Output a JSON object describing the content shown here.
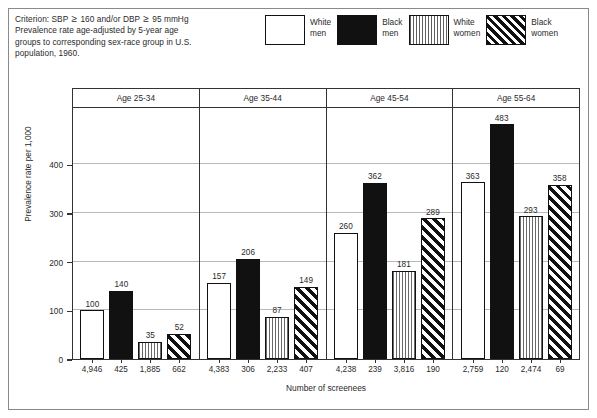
{
  "caption": {
    "line1_pre": "Criterion: SBP ",
    "line1_ge1": "≥",
    "line1_mid": " 160 and/or DBP ",
    "line1_ge2": "≥",
    "line1_post": " 95 mmHg",
    "line2": "Prevalence rate age-adjusted by 5-year age",
    "line3": "groups to corresponding sex-race group in U.S.",
    "line4": "population, 1960."
  },
  "legend": {
    "items": [
      {
        "label": "White\nmen",
        "swatch": "white-box-swatch"
      },
      {
        "label": "Black\nmen",
        "swatch": "solid-black-swatch"
      },
      {
        "label": "White\nwomen",
        "swatch": "vertical-stripe-swatch"
      },
      {
        "label": "Black\nwomen",
        "swatch": "diagonal-stripe-swatch"
      }
    ]
  },
  "chart_data": {
    "type": "bar",
    "title": "",
    "xlabel": "Number of screenees",
    "ylabel": "Prevalence rate per 1,000",
    "ylim": [
      0,
      520
    ],
    "yticks": [
      0,
      100,
      200,
      300,
      400
    ],
    "ytick_labels": [
      "0",
      "100",
      "200",
      "300",
      "400"
    ],
    "grid": true,
    "legend_position": "top-right",
    "categories": [
      "Age 25-34",
      "Age 35-44",
      "Age 45-54",
      "Age 55-64"
    ],
    "series": [
      {
        "name": "White men",
        "values": [
          100,
          157,
          260,
          363
        ],
        "screenees": [
          "4,946",
          "4,383",
          "4,238",
          "2,759"
        ]
      },
      {
        "name": "Black men",
        "values": [
          140,
          206,
          362,
          483
        ],
        "screenees": [
          "425",
          "306",
          "239",
          "120"
        ]
      },
      {
        "name": "White women",
        "values": [
          35,
          87,
          181,
          293
        ],
        "screenees": [
          "1,885",
          "2,233",
          "3,816",
          "2,474"
        ]
      },
      {
        "name": "Black women",
        "values": [
          52,
          149,
          289,
          358
        ],
        "screenees": [
          "662",
          "407",
          "190",
          "69"
        ]
      }
    ],
    "groups": [
      {
        "label": "Age 25-34",
        "bars": [
          {
            "series": "White men",
            "value": 100,
            "value_label": "100",
            "screenees": "4,946",
            "fill": "white"
          },
          {
            "series": "Black men",
            "value": 140,
            "value_label": "140",
            "screenees": "425",
            "fill": "black"
          },
          {
            "series": "White women",
            "value": 35,
            "value_label": "35",
            "screenees": "1,885",
            "fill": "vstripe"
          },
          {
            "series": "Black women",
            "value": 52,
            "value_label": "52",
            "screenees": "662",
            "fill": "dstripe"
          }
        ]
      },
      {
        "label": "Age 35-44",
        "bars": [
          {
            "series": "White men",
            "value": 157,
            "value_label": "157",
            "screenees": "4,383",
            "fill": "white"
          },
          {
            "series": "Black men",
            "value": 206,
            "value_label": "206",
            "screenees": "306",
            "fill": "black"
          },
          {
            "series": "White women",
            "value": 87,
            "value_label": "87",
            "screenees": "2,233",
            "fill": "vstripe"
          },
          {
            "series": "Black women",
            "value": 149,
            "value_label": "149",
            "screenees": "407",
            "fill": "dstripe"
          }
        ]
      },
      {
        "label": "Age 45-54",
        "bars": [
          {
            "series": "White men",
            "value": 260,
            "value_label": "260",
            "screenees": "4,238",
            "fill": "white"
          },
          {
            "series": "Black men",
            "value": 362,
            "value_label": "362",
            "screenees": "239",
            "fill": "black"
          },
          {
            "series": "White women",
            "value": 181,
            "value_label": "181",
            "screenees": "3,816",
            "fill": "vstripe"
          },
          {
            "series": "Black women",
            "value": 289,
            "value_label": "289",
            "screenees": "190",
            "fill": "dstripe"
          }
        ]
      },
      {
        "label": "Age 55-64",
        "bars": [
          {
            "series": "White men",
            "value": 363,
            "value_label": "363",
            "screenees": "2,759",
            "fill": "white"
          },
          {
            "series": "Black men",
            "value": 483,
            "value_label": "483",
            "screenees": "120",
            "fill": "black"
          },
          {
            "series": "White women",
            "value": 293,
            "value_label": "293",
            "screenees": "2,474",
            "fill": "vstripe"
          },
          {
            "series": "Black women",
            "value": 358,
            "value_label": "358",
            "screenees": "69",
            "fill": "dstripe"
          }
        ]
      }
    ]
  },
  "colors": {
    "bar_black": "#111111",
    "frame": "#333333",
    "grid": "#b9b9b9",
    "text": "#2a2a2a"
  }
}
